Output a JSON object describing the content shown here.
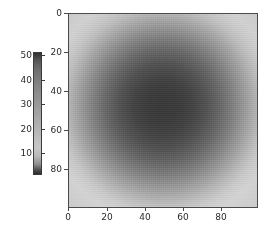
{
  "figure": {
    "background_color": "#ffffff",
    "width": 268,
    "height": 237
  },
  "chart_data": {
    "type": "heatmap",
    "title": "",
    "xlabel": "",
    "ylabel": "",
    "colormap": "gray",
    "x": [
      0,
      20,
      40,
      60,
      80
    ],
    "y": [
      0,
      20,
      40,
      60,
      80
    ],
    "xlim": [
      0,
      99
    ],
    "ylim": [
      99,
      0
    ],
    "grid": false,
    "xticks": [
      "0",
      "20",
      "40",
      "60",
      "80"
    ],
    "yticks": [
      "0",
      "20",
      "40",
      "60",
      "80"
    ],
    "image_extent": {
      "rows": 100,
      "cols": 100,
      "center_row": 48,
      "center_col": 50,
      "center_value": 8,
      "edge_value": 52,
      "min_value": 5,
      "max_value": 55
    },
    "colorbar": {
      "orientation": "vertical",
      "position": "left",
      "ticks": [
        50,
        40,
        30,
        20,
        10
      ],
      "tick_labels": [
        "50",
        "40",
        "30",
        "20",
        "10"
      ],
      "vmin": 5,
      "vmax": 55,
      "low_color": "#2e2e2e",
      "high_color": "#c6c6c6"
    }
  },
  "colorbar_axis": {
    "ticks": [
      {
        "label": "50",
        "top": 51
      },
      {
        "label": "40",
        "top": 76
      },
      {
        "label": "30",
        "top": 100
      },
      {
        "label": "20",
        "top": 125
      },
      {
        "label": "10",
        "top": 149
      }
    ]
  },
  "x_axis": {
    "ticks": [
      {
        "label": "0",
        "left": 68
      },
      {
        "label": "20",
        "left": 107
      },
      {
        "label": "40",
        "left": 145
      },
      {
        "label": "60",
        "left": 183
      },
      {
        "label": "80",
        "left": 221
      }
    ]
  },
  "y_axis": {
    "ticks": [
      {
        "label": "0",
        "top": 13
      },
      {
        "label": "20",
        "top": 52
      },
      {
        "label": "40",
        "top": 91
      },
      {
        "label": "60",
        "top": 130
      },
      {
        "label": "80",
        "top": 169
      }
    ]
  }
}
